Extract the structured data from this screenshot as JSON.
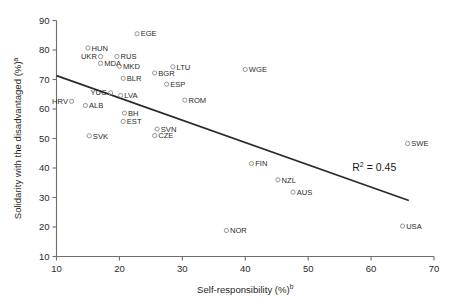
{
  "chart_data": {
    "type": "scatter",
    "title": "",
    "xlabel": "Self-responsibility (%)",
    "xlabel_sup": "b",
    "ylabel": "Solidarity with the disadvantaged (%)",
    "ylabel_sup": "a",
    "xlim": [
      10,
      70
    ],
    "ylim": [
      10,
      90
    ],
    "xticks": [
      10,
      20,
      30,
      40,
      50,
      60,
      70
    ],
    "yticks": [
      10,
      20,
      30,
      40,
      50,
      60,
      70,
      80,
      90
    ],
    "grid": false,
    "legend": null,
    "annotations": [
      {
        "name": "r2-annotation",
        "text": "R",
        "sup": "2",
        "rest": " = 0.45",
        "x": 60.5,
        "y": 39.0
      }
    ],
    "trendline": {
      "name": "regression-line",
      "x_start": 10.0,
      "y_start": 71.3,
      "x_end": 66.0,
      "y_end": 29.0,
      "r_squared": 0.45
    },
    "points": [
      {
        "label": "EGE",
        "x": 22.8,
        "y": 85.5,
        "label_side": "right"
      },
      {
        "label": "HUN",
        "x": 15.0,
        "y": 80.7,
        "label_side": "right"
      },
      {
        "label": "UKR",
        "x": 17.0,
        "y": 77.8,
        "label_side": "left"
      },
      {
        "label": "RUS",
        "x": 19.6,
        "y": 77.8,
        "label_side": "right"
      },
      {
        "label": "MDA",
        "x": 17.0,
        "y": 75.5,
        "label_side": "right"
      },
      {
        "label": "MKD",
        "x": 20.0,
        "y": 74.5,
        "label_side": "right"
      },
      {
        "label": "LTU",
        "x": 28.5,
        "y": 74.3,
        "label_side": "right"
      },
      {
        "label": "BGR",
        "x": 25.6,
        "y": 72.2,
        "label_side": "right"
      },
      {
        "label": "BLR",
        "x": 20.6,
        "y": 70.4,
        "label_side": "right"
      },
      {
        "label": "ESP",
        "x": 27.5,
        "y": 68.4,
        "label_side": "right"
      },
      {
        "label": "WGE",
        "x": 40.0,
        "y": 73.4,
        "label_side": "right"
      },
      {
        "label": "YUG",
        "x": 18.6,
        "y": 65.5,
        "label_side": "left"
      },
      {
        "label": "LVA",
        "x": 20.2,
        "y": 64.6,
        "label_side": "right"
      },
      {
        "label": "HRV",
        "x": 12.4,
        "y": 62.6,
        "label_side": "left"
      },
      {
        "label": "ALB",
        "x": 14.6,
        "y": 61.2,
        "label_side": "right"
      },
      {
        "label": "ROM",
        "x": 30.4,
        "y": 63.0,
        "label_side": "right"
      },
      {
        "label": "BH",
        "x": 20.8,
        "y": 58.6,
        "label_side": "right"
      },
      {
        "label": "EST",
        "x": 20.6,
        "y": 55.8,
        "label_side": "right"
      },
      {
        "label": "SVN",
        "x": 26.0,
        "y": 53.2,
        "label_side": "right"
      },
      {
        "label": "CZE",
        "x": 25.6,
        "y": 51.0,
        "label_side": "right"
      },
      {
        "label": "SVK",
        "x": 15.2,
        "y": 50.9,
        "label_side": "right"
      },
      {
        "label": "SWE",
        "x": 65.8,
        "y": 48.3,
        "label_side": "right"
      },
      {
        "label": "FIN",
        "x": 41.0,
        "y": 41.5,
        "label_side": "right"
      },
      {
        "label": "NZL",
        "x": 45.2,
        "y": 36.0,
        "label_side": "right"
      },
      {
        "label": "AUS",
        "x": 47.6,
        "y": 31.8,
        "label_side": "right"
      },
      {
        "label": "USA",
        "x": 65.0,
        "y": 20.3,
        "label_side": "right"
      },
      {
        "label": "NOR",
        "x": 37.0,
        "y": 18.8,
        "label_side": "right"
      }
    ]
  }
}
